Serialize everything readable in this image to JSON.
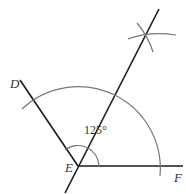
{
  "diagram": {
    "type": "angle-bisector-construction",
    "angle_label": "125°",
    "points": {
      "D": "D",
      "E": "E",
      "F": "F"
    },
    "colors": {
      "ray": "#1a1a1a",
      "arc": "#777777",
      "text": "#333333"
    }
  }
}
